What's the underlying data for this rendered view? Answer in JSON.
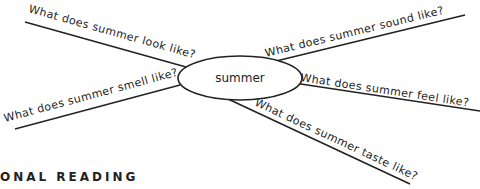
{
  "web_map": {
    "center": "summer",
    "branches": [
      {
        "id": "look",
        "label": "What does summer look like?"
      },
      {
        "id": "sound",
        "label": "What does summer sound like?"
      },
      {
        "id": "feel",
        "label": "What does summer feel like?"
      },
      {
        "id": "smell",
        "label": "What does summer smell like?"
      },
      {
        "id": "taste",
        "label": "What does summer taste like?"
      }
    ]
  },
  "section_heading": "ONAL READING",
  "colors": {
    "ink": "#222222",
    "background": "#ffffff"
  }
}
